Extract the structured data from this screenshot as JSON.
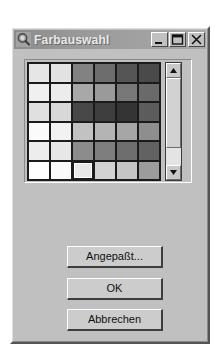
{
  "window": {
    "title": "Farbauswahl",
    "icon": "color-picker-icon",
    "titlebar_buttons": [
      {
        "name": "minimize-button",
        "glyph": "minimize-icon",
        "label": "_"
      },
      {
        "name": "maximize-button",
        "glyph": "maximize-icon",
        "label": "□"
      },
      {
        "name": "close-button",
        "glyph": "close-icon",
        "label": "✕"
      }
    ]
  },
  "palette": {
    "rows": 6,
    "columns": 6,
    "selected_row": 6,
    "selected_column": 3,
    "selected_color": "#e8e8e8",
    "colors": [
      [
        "#e6e6e6",
        "#e2e2e2",
        "#828282",
        "#6d6d6d",
        "#555555",
        "#4a4a4a"
      ],
      [
        "#f0f0f0",
        "#ececec",
        "#a8a8a8",
        "#9a9a9a",
        "#787878",
        "#6a6a6a"
      ],
      [
        "#e0e0e0",
        "#d8d8d8",
        "#484848",
        "#3e3e3e",
        "#343434",
        "#5c5c5c"
      ],
      [
        "#fbfbfb",
        "#f2f2f2",
        "#c2c2c2",
        "#b4b4b4",
        "#a6a6a6",
        "#8e8e8e"
      ],
      [
        "#ededed",
        "#e7e7e7",
        "#8c8c8c",
        "#7e7e7e",
        "#6e6e6e",
        "#626262"
      ],
      [
        "#ffffff",
        "#fafafa",
        "#e8e8e8",
        "#d2d2d2",
        "#c6c6c6",
        "#9c9c9c"
      ]
    ]
  },
  "scrollbar": {
    "up_arrow": "scroll-up-icon",
    "down_arrow": "scroll-down-icon",
    "orientation": "vertical"
  },
  "buttons": {
    "custom": "Angepaßt...",
    "ok": "OK",
    "cancel": "Abbrechen"
  }
}
